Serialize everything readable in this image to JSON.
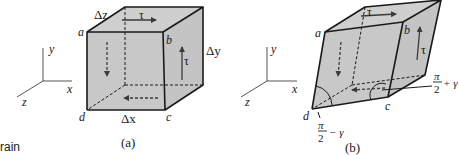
{
  "figure": {
    "caption_partial": "rain",
    "panels": [
      {
        "id": "a",
        "caption": "(a)",
        "axes": {
          "x": "x",
          "y": "y",
          "z": "z"
        },
        "vertices": {
          "a": "a",
          "b": "b",
          "c": "c",
          "d": "d"
        },
        "dimensions": {
          "dx": "Δx",
          "dy": "Δy",
          "dz": "Δz"
        },
        "stress_labels": {
          "top": "τ",
          "right": "τ"
        }
      },
      {
        "id": "b",
        "caption": "(b)",
        "axes": {
          "x": "x",
          "y": "y",
          "z": "z"
        },
        "vertices": {
          "a": "a",
          "b": "b",
          "c": "c",
          "d": "d"
        },
        "stress_labels": {
          "top": "τ",
          "right": "τ"
        },
        "angles": {
          "at_d": {
            "num": "π",
            "den": "2",
            "op": "− γ"
          },
          "at_c": {
            "num": "π",
            "den": "2",
            "op": "+ γ"
          }
        }
      }
    ]
  },
  "colors": {
    "face_fill": "#c8c8c8",
    "edge": "#1a1a1a",
    "arrow": "#3a3a3a",
    "axis": "#555555"
  }
}
